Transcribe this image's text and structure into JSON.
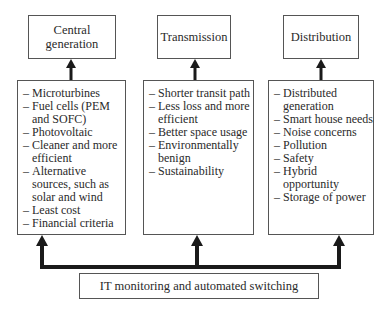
{
  "diagram": {
    "top_boxes": [
      {
        "label": "Central generation"
      },
      {
        "label": "Transmission"
      },
      {
        "label": "Distribution"
      }
    ],
    "detail_boxes": [
      {
        "items": [
          "Microturbines",
          "Fuel cells (PEM and SOFC)",
          "Photovoltaic",
          "Cleaner and more efficient",
          "Alternative sources, such as solar and wind",
          "Least cost",
          "Financial criteria"
        ]
      },
      {
        "items": [
          "Shorter transit path",
          "Less loss and more efficient",
          "Better space usage",
          "Environmentally benign",
          "Sustainability"
        ]
      },
      {
        "items": [
          "Distributed generation",
          "Smart house needs",
          "Noise concerns",
          "Pollution",
          "Safety",
          "Hybrid opportunity",
          "Storage of power"
        ]
      }
    ],
    "bottom_box": {
      "label": "IT monitoring and automated switching"
    },
    "colors": {
      "line": "#1a1a1a",
      "border": "#555555",
      "text": "#2a2a2a"
    }
  }
}
